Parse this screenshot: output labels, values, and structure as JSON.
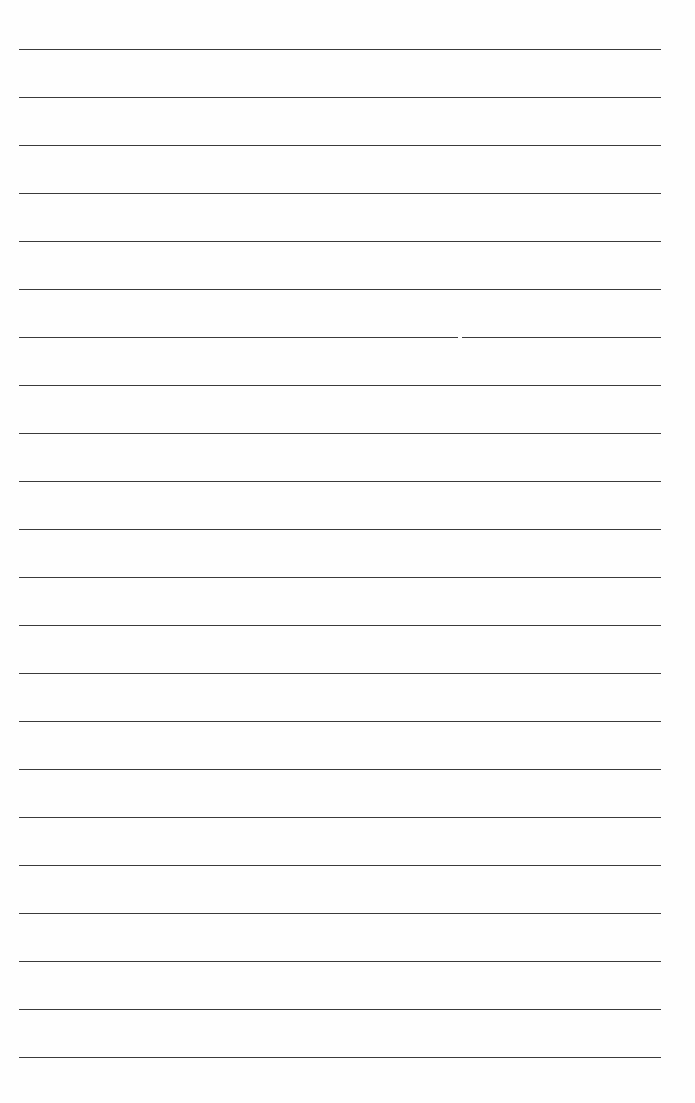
{
  "page": {
    "type": "lined-paper",
    "background_color": "#fefefe",
    "line_color": "#3a3a3a",
    "line_count": 22,
    "line_left_px": 19,
    "line_right_px": 661,
    "first_line_y_px": 49.5,
    "line_spacing_px": 48,
    "lines": [
      {
        "index": 0,
        "text": ""
      },
      {
        "index": 1,
        "text": ""
      },
      {
        "index": 2,
        "text": ""
      },
      {
        "index": 3,
        "text": ""
      },
      {
        "index": 4,
        "text": ""
      },
      {
        "index": 5,
        "text": ""
      },
      {
        "index": 6,
        "text": ""
      },
      {
        "index": 7,
        "text": ""
      },
      {
        "index": 8,
        "text": ""
      },
      {
        "index": 9,
        "text": ""
      },
      {
        "index": 10,
        "text": ""
      },
      {
        "index": 11,
        "text": ""
      },
      {
        "index": 12,
        "text": ""
      },
      {
        "index": 13,
        "text": ""
      },
      {
        "index": 14,
        "text": ""
      },
      {
        "index": 15,
        "text": ""
      },
      {
        "index": 16,
        "text": ""
      },
      {
        "index": 17,
        "text": ""
      },
      {
        "index": 18,
        "text": ""
      },
      {
        "index": 19,
        "text": ""
      },
      {
        "index": 20,
        "text": ""
      },
      {
        "index": 21,
        "text": ""
      }
    ]
  }
}
